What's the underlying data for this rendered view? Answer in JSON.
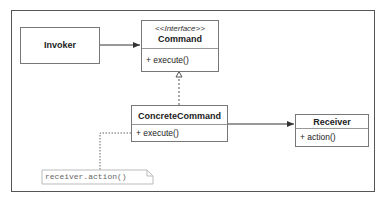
{
  "diagram": {
    "type": "UML class diagram",
    "pattern": "Command",
    "classes": [
      {
        "id": "invoker",
        "name": "Invoker",
        "operations": []
      },
      {
        "id": "command",
        "stereotype": "<<Interface>>",
        "name": "Command",
        "operations": [
          "+ execute()"
        ]
      },
      {
        "id": "concrete_command",
        "name": "ConcreteCommand",
        "operations": [
          "+ execute()"
        ]
      },
      {
        "id": "receiver",
        "name": "Receiver",
        "operations": [
          "+ action()"
        ]
      }
    ],
    "relations": [
      {
        "from": "Invoker",
        "to": "Command",
        "type": "association"
      },
      {
        "from": "ConcreteCommand",
        "to": "Command",
        "type": "realization"
      },
      {
        "from": "ConcreteCommand",
        "to": "Receiver",
        "type": "association"
      }
    ],
    "note": "receiver.action()"
  },
  "colors": {
    "border": "#777777",
    "frame": "#555555",
    "note_text": "#666666"
  }
}
